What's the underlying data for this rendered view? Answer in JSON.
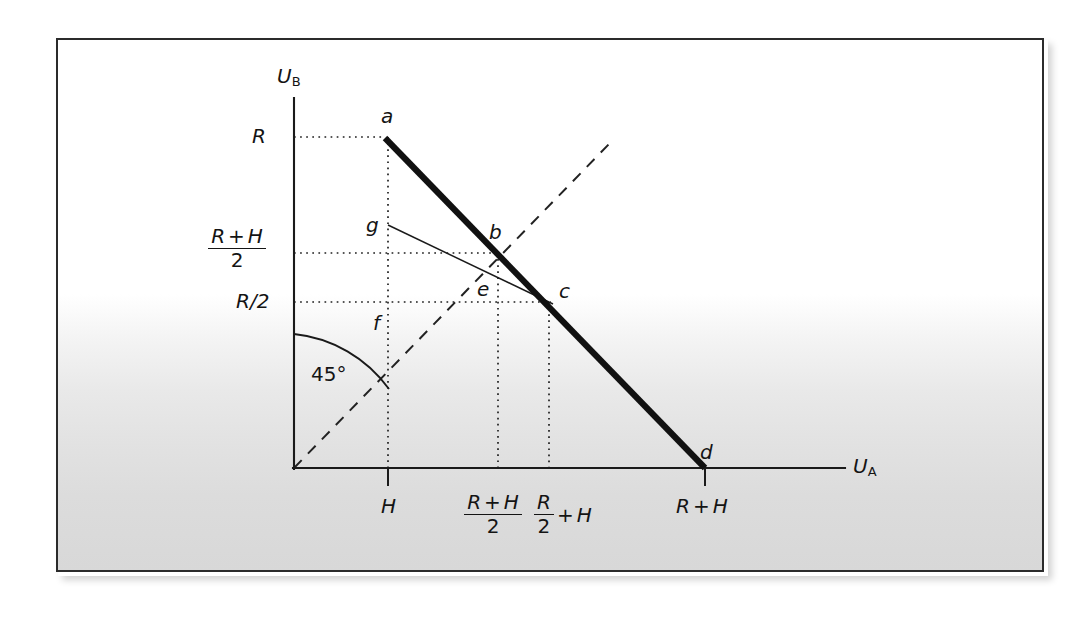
{
  "figure": {
    "kind": "utility-possibility-frontier-diagram",
    "background_note": "scanned page with gray gradient toward bottom"
  },
  "axes": {
    "x_label": "U",
    "x_label_sub": "A",
    "y_label": "U",
    "y_label_sub": "B"
  },
  "angle": {
    "label": "45°"
  },
  "points": [
    {
      "id": "a",
      "label": "a",
      "x_value": "H",
      "y_value": "R"
    },
    {
      "id": "b",
      "label": "b",
      "x_value": "(R+H)/2",
      "y_value": "(R+H)/2"
    },
    {
      "id": "c",
      "label": "c",
      "x_value": "R/2 + H",
      "y_value": "R/2"
    },
    {
      "id": "d",
      "label": "d",
      "x_value": "R+H",
      "y_value": "0"
    },
    {
      "id": "e",
      "label": "e",
      "x_value": "",
      "y_value": ""
    },
    {
      "id": "f",
      "label": "f",
      "x_value": "H",
      "y_value": ""
    },
    {
      "id": "g",
      "label": "g",
      "x_value": "H",
      "y_value": ""
    }
  ],
  "y_ticks": [
    {
      "id": "R",
      "text": "R",
      "kind": "plain"
    },
    {
      "id": "R_plus_H_over_2",
      "numerator_left": "R",
      "numerator_op": "+",
      "numerator_right": "H",
      "denominator": "2",
      "kind": "fraction"
    },
    {
      "id": "R_over_2",
      "text": "R/2",
      "kind": "plain"
    }
  ],
  "x_ticks": [
    {
      "id": "H",
      "text": "H",
      "kind": "plain"
    },
    {
      "id": "R_plus_H_over_2",
      "numerator_left": "R",
      "numerator_op": "+",
      "numerator_right": "H",
      "denominator": "2",
      "kind": "fraction"
    },
    {
      "id": "R_over_2_plus_H",
      "numerator": "R",
      "denominator": "2",
      "op": "+",
      "trailing": "H",
      "kind": "inline-fraction"
    },
    {
      "id": "R_plus_H",
      "left": "R",
      "op": "+",
      "right": "H",
      "kind": "sum"
    }
  ],
  "colors": {
    "ink": "#141414",
    "frame": "#2b2b2b",
    "paper": "#ffffff"
  }
}
